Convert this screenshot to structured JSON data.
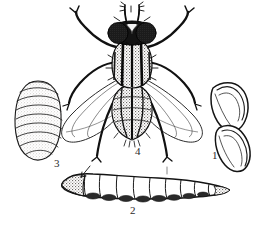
{
  "figure": {
    "background_color": "#ffffff",
    "ink_color": "#1a1a1a",
    "shading_color": "#b9b3ad",
    "label_color": "#2b2b2b",
    "caption": "",
    "caption_note": "bottom caption line is cropped off and illegible",
    "labels": [
      {
        "id": "1",
        "text": "1",
        "refers_to": "eggs"
      },
      {
        "id": "2",
        "text": "2",
        "refers_to": "larva"
      },
      {
        "id": "3",
        "text": "3",
        "refers_to": "pupa"
      },
      {
        "id": "4",
        "text": "4",
        "refers_to": "adult-fly"
      }
    ],
    "stages": [
      {
        "number": "1",
        "name": "eggs",
        "count": 2,
        "description": "two elongated ribbed eggs, upper right"
      },
      {
        "number": "2",
        "name": "larva",
        "count": 1,
        "description": "segmented maggot, bottom center"
      },
      {
        "number": "3",
        "name": "pupa",
        "count": 1,
        "description": "banded oval puparium, left"
      },
      {
        "number": "4",
        "name": "adult-fly",
        "count": 1,
        "description": "adult fly, dorsal view, wings spread"
      }
    ]
  }
}
